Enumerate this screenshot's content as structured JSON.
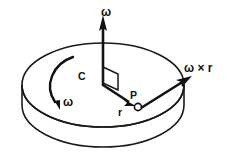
{
  "figure": {
    "background_color": "#ffffff",
    "ink_color": "#111111",
    "width": 227,
    "height": 163
  },
  "labels": {
    "omega_axis": "ω",
    "omega_spin": "ω",
    "center": "C",
    "radius": "r",
    "point": "P",
    "cross_product": "ω × r"
  },
  "elements": {
    "disk": {
      "name": "rotating-disk",
      "shape": "cylinder",
      "top_face": "ellipse",
      "center_x": 103,
      "center_y": 85,
      "radius_x": 81,
      "radius_y": 42,
      "thickness": 20
    },
    "axis_vector": {
      "name": "angular-velocity-axis-vector",
      "from": [
        103,
        85
      ],
      "to": [
        103,
        14
      ],
      "direction": "up"
    },
    "radius_vector": {
      "name": "radius-vector",
      "from": [
        103,
        85
      ],
      "to": [
        134,
        105
      ],
      "direction": "down-right"
    },
    "cross_vector": {
      "name": "omega-cross-r-vector",
      "from": [
        140,
        108
      ],
      "to": [
        191,
        77
      ],
      "direction": "up-right"
    },
    "spin_arc": {
      "name": "rotation-direction-arc",
      "direction": "counterclockwise",
      "start": [
        73,
        57
      ],
      "end": [
        58,
        107
      ]
    },
    "right_angle_marker": {
      "name": "right-angle-marker",
      "points": "103,68 117,74 117,90 103,84"
    },
    "point_p": {
      "name": "point-p-marker",
      "cx": 137,
      "cy": 107,
      "r": 3.6
    }
  },
  "label_positions": {
    "omega_axis": [
      101,
      14
    ],
    "omega_spin": [
      63,
      104
    ],
    "center": [
      82,
      79
    ],
    "radius": [
      119,
      114
    ],
    "point": [
      130,
      97
    ],
    "cross_product": [
      185,
      70
    ]
  }
}
